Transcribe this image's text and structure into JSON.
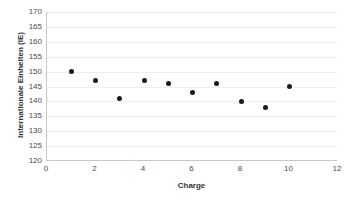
{
  "chart_data": {
    "type": "scatter",
    "title": "",
    "xlabel": "Charge",
    "ylabel": "Internationale Einheiten (IE)",
    "xlim": [
      0,
      12
    ],
    "ylim": [
      120,
      170
    ],
    "xticks": [
      0,
      2,
      4,
      6,
      8,
      10,
      12
    ],
    "yticks": [
      120,
      125,
      130,
      135,
      140,
      145,
      150,
      155,
      160,
      165,
      170
    ],
    "grid": "horizontal",
    "legend": "none",
    "marker": "filled-circle",
    "marker_color": "#1a1a1a",
    "x": [
      1,
      2,
      3,
      4,
      5,
      6,
      7,
      8,
      9,
      10
    ],
    "values": [
      150,
      147,
      141,
      147,
      146,
      143,
      146,
      140,
      138,
      145
    ],
    "points": [
      {
        "x": 1,
        "y": 150
      },
      {
        "x": 2,
        "y": 147
      },
      {
        "x": 3,
        "y": 141
      },
      {
        "x": 4,
        "y": 147
      },
      {
        "x": 5,
        "y": 146
      },
      {
        "x": 6,
        "y": 143
      },
      {
        "x": 7,
        "y": 146
      },
      {
        "x": 8,
        "y": 140
      },
      {
        "x": 9,
        "y": 138
      },
      {
        "x": 10,
        "y": 145
      }
    ]
  },
  "colors": {
    "gridline": "#ededed",
    "axis": "#c8c8c8",
    "marker": "#1a1a1a",
    "text": "#4a4a4a",
    "background": "#ffffff"
  }
}
